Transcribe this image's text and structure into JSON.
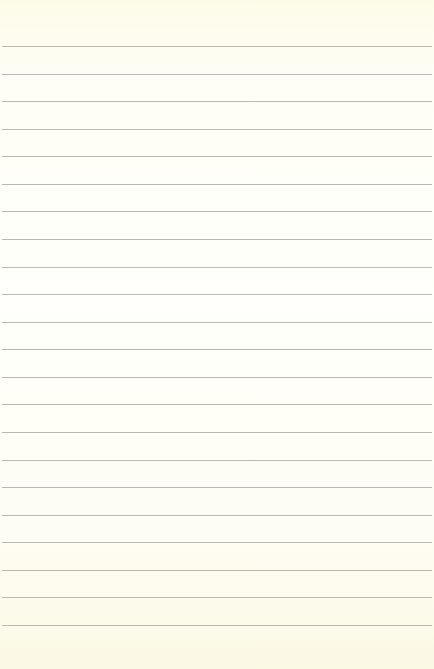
{
  "paper": {
    "background": "#fefdf2",
    "line_color": "#b9b9b2",
    "line_count": 22,
    "first_line_y": 46,
    "line_spacing": 27.57
  }
}
